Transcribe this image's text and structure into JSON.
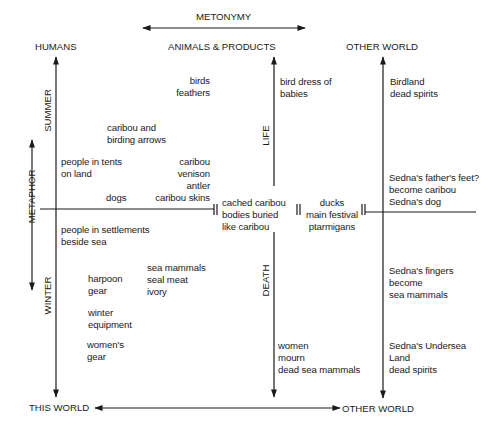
{
  "diagram": {
    "axes": {
      "metonymy": "METONYMY",
      "metaphor": "METAPHOR",
      "summer": "SUMMER",
      "winter": "WINTER",
      "life": "LIFE",
      "death": "DEATH"
    },
    "columns": {
      "humans": "HUMANS",
      "animals_products": "ANIMALS & PRODUCTS",
      "other_world_top": "OTHER WORLD"
    },
    "bottom": {
      "this_world": "THIS WORLD",
      "other_world": "OTHER WORLD"
    },
    "humans_summer": [
      "people in tents\non land",
      "dogs"
    ],
    "humans_winter": [
      "people in settlements\nbeside sea",
      "harpoon\ngear",
      "winter\nequipment",
      "women's\ngear"
    ],
    "animals_summer": [
      "birds\nfeathers",
      "caribou and\nbirding arrows",
      "caribou\nvenison\nantler\ncaribou skins"
    ],
    "animals_winter": [
      "sea mammals\nseal meat\nivory"
    ],
    "center": {
      "cached": "cached caribou\nbodies buried\nlike caribou",
      "festival": "ducks\nmain festival\nptarmigans"
    },
    "life_side": "bird dress of\nbabies",
    "death_side": "women\nmourn\ndead sea mammals",
    "other_world_items": [
      "Birdland\ndead spirits",
      "Sedna's father's feet?\nbecome caribou\nSedna's dog",
      "Sedna's fingers\nbecome\nsea mammals",
      "Sedna's Undersea\nLand\ndead spirits"
    ]
  }
}
